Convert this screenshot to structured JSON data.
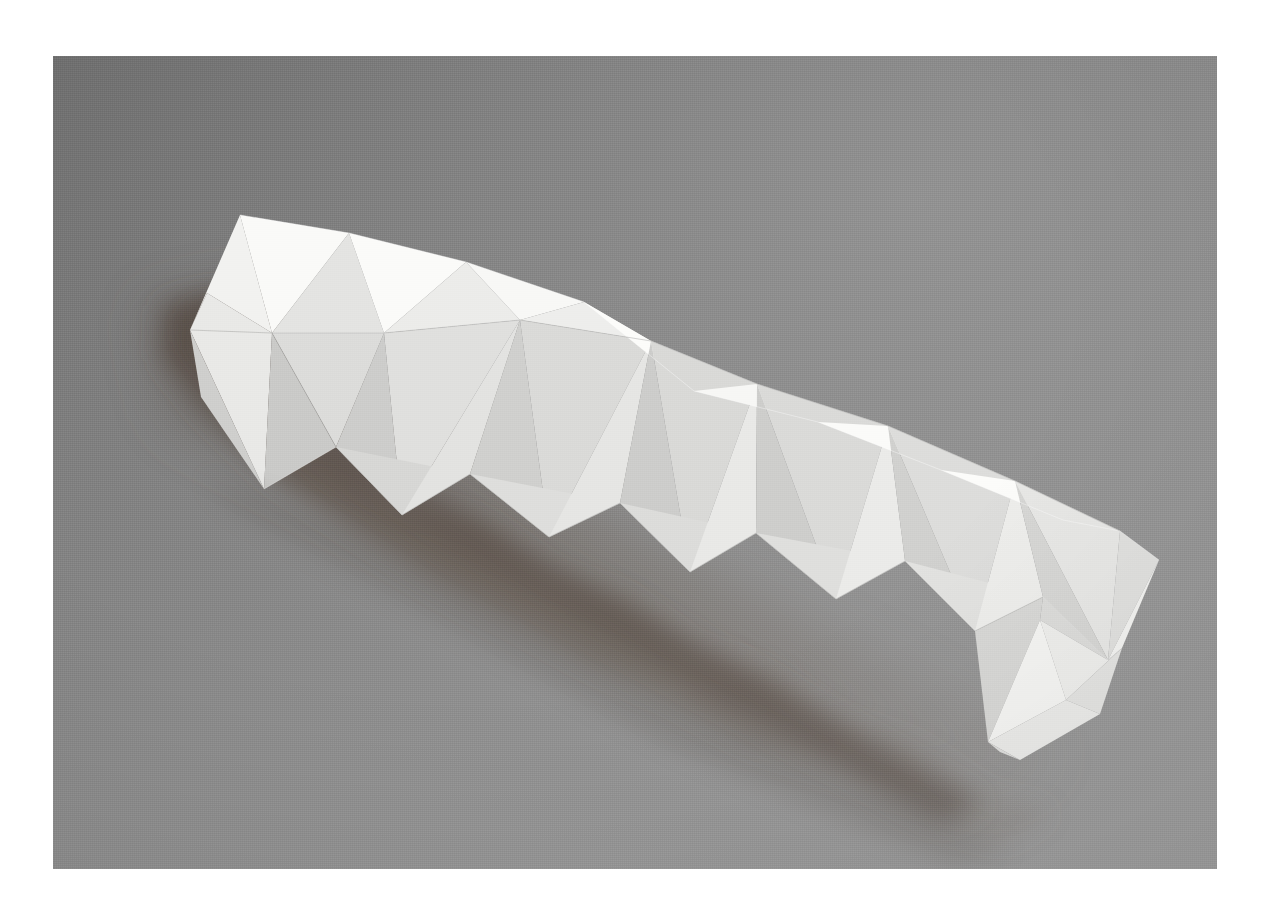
{
  "page": {
    "background_color": "#ffffff",
    "width": 1271,
    "height": 920
  },
  "photo": {
    "title": "White folded paper sculpture on gray backdrop",
    "subject": "faceted paper tube",
    "frame": {
      "x": 53,
      "y": 56,
      "width": 1164,
      "height": 813
    },
    "border_color": "#ffffff",
    "background": {
      "top_left_color": "#6f6f6f",
      "top_right_color": "#8a8a8a",
      "mid_color": "#878787",
      "bottom_left_color": "#9a9a9a",
      "bottom_right_color": "#9c9c9c"
    },
    "shadow": {
      "color": "#6b6058",
      "tone": "warm gray-brown",
      "direction": "lower-left"
    },
    "sculpture": {
      "material": "white paper",
      "form": "elongated faceted prism with zigzag triangular folds",
      "orientation": "diagonal, upper-left to lower-right",
      "highlight_color": "#f6f6f4",
      "midtone_color": "#e2e2e0",
      "shade_color": "#c9c9c7",
      "deep_shade_color": "#b3b3b1",
      "facet_count": 46
    },
    "geometry": {
      "top_ridge": [
        [
          207,
          293
        ],
        [
          240,
          215
        ],
        [
          272,
          333
        ],
        [
          349,
          233
        ],
        [
          384,
          333
        ],
        [
          466,
          262
        ],
        [
          520,
          320
        ],
        [
          584,
          302
        ],
        [
          651,
          341
        ],
        [
          694,
          391
        ],
        [
          757,
          384
        ],
        [
          818,
          422
        ],
        [
          888,
          426
        ],
        [
          941,
          470
        ],
        [
          1015,
          481
        ],
        [
          1063,
          520
        ],
        [
          1120,
          531
        ]
      ],
      "bottom_ridge": [
        [
          201,
          397
        ],
        [
          264,
          489
        ],
        [
          336,
          447
        ],
        [
          402,
          515
        ],
        [
          470,
          474
        ],
        [
          549,
          537
        ],
        [
          620,
          503
        ],
        [
          690,
          572
        ],
        [
          756,
          533
        ],
        [
          836,
          599
        ],
        [
          905,
          561
        ],
        [
          975,
          631
        ],
        [
          1043,
          597
        ],
        [
          1108,
          660
        ]
      ],
      "left_tip": [
        190,
        330
      ],
      "right_tip": [
        1159,
        560
      ],
      "tail_points": [
        [
          988,
          742
        ],
        [
          1122,
          648
        ],
        [
          1040,
          620
        ]
      ]
    }
  }
}
